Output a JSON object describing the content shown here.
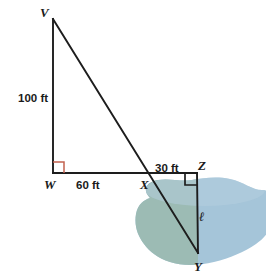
{
  "figure": {
    "background_color": "#ffffff",
    "line_color": "#1d1d1d",
    "right_angle_w_color": "#c2614f",
    "right_angle_z_color": "#1d1d1d",
    "lake_green_color": "#9bbbb2",
    "lake_blue_color": "#a5c5d9"
  },
  "vertices": [
    {
      "id": "V",
      "label": "V",
      "x": 53,
      "y": 19,
      "label_x": 40,
      "label_y": 17
    },
    {
      "id": "W",
      "label": "W",
      "x": 53,
      "y": 173,
      "label_x": 44,
      "label_y": 189
    },
    {
      "id": "X",
      "label": "X",
      "x": 148,
      "y": 173,
      "label_x": 140,
      "label_y": 189
    },
    {
      "id": "Z",
      "label": "Z",
      "x": 197,
      "y": 173,
      "label_x": 198,
      "label_y": 170
    },
    {
      "id": "Y",
      "label": "Y",
      "x": 198,
      "y": 253,
      "label_x": 194,
      "label_y": 271
    }
  ],
  "segments": [
    {
      "name": "segment-VW",
      "from": "V",
      "to": "W"
    },
    {
      "name": "segment-WZ",
      "from": "W",
      "to": "Z"
    },
    {
      "name": "segment-VY",
      "from": "V",
      "to": "Y"
    },
    {
      "name": "segment-ZY",
      "from": "Z",
      "to": "Y"
    }
  ],
  "measurements": [
    {
      "name": "label-100-ft",
      "text": "100 ft",
      "x": 18,
      "y": 102,
      "segment": "VW"
    },
    {
      "name": "label-60-ft",
      "text": "60 ft",
      "x": 76,
      "y": 189,
      "segment": "WX"
    },
    {
      "name": "label-30-ft",
      "text": "30 ft",
      "x": 155,
      "y": 172,
      "segment": "XZ"
    },
    {
      "name": "label-ell",
      "text": "ℓ",
      "x": 199,
      "y": 221,
      "segment": "ZY"
    }
  ],
  "right_angles": [
    {
      "name": "right-angle-W",
      "at": "W",
      "color": "#c2614f"
    },
    {
      "name": "right-angle-Z",
      "at": "Z",
      "color": "#1d1d1d"
    }
  ],
  "lake": {
    "name": "lake-shape",
    "green_fill": "#9bbbb2",
    "blue_fill": "#a5c5d9"
  }
}
